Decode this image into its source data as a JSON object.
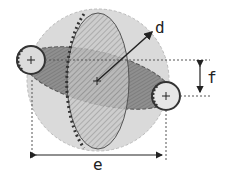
{
  "diagram": {
    "labels": {
      "d": "d",
      "e": "e",
      "f": "f"
    },
    "colors": {
      "sphere_fill": "#d9d9d9",
      "orbit_fill": "#8f8f8f",
      "hatch_fill": "#bdbdbd",
      "outline": "#444444",
      "dots": "#333333"
    },
    "elements": [
      "outer-sphere",
      "meridian-ellipse-hatched",
      "tilted-orbit-ellipse",
      "left-small-circle",
      "right-small-circle",
      "radius-arrow-d",
      "width-arrow-e",
      "offset-arrow-f"
    ]
  }
}
